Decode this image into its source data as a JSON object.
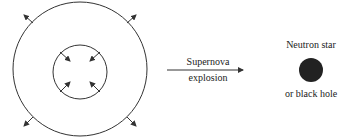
{
  "diagram": {
    "arrow_label_top": "Supernova",
    "arrow_label_bottom": "explosion",
    "result_label_top": "Neutron star",
    "result_label_bottom": "or black hole",
    "colors": {
      "stroke": "#333333",
      "remnant": "#222222"
    }
  }
}
